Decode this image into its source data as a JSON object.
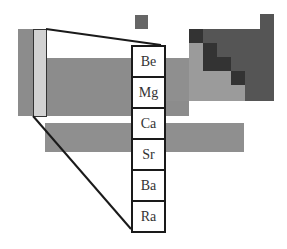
{
  "diagram": {
    "highlighted_group": {
      "elements": [
        "Be",
        "Mg",
        "Ca",
        "Sr",
        "Ba",
        "Ra"
      ]
    },
    "colors": {
      "group1": "#8c8c8c",
      "highlight": "#d2d2d2",
      "body": "#8c8c8c",
      "metalloid_region": "#9b9b9b",
      "nonmetal_region": "#555555",
      "staircase": "#333333",
      "f_block": "#8f8f8f",
      "outline": "#1a1a1a"
    }
  }
}
